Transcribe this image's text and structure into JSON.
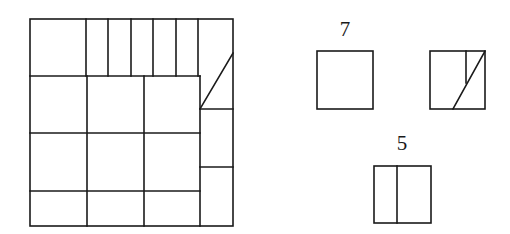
{
  "diagram": {
    "title": "",
    "big_square": {
      "outer": {
        "x1": 30,
        "y1": 19,
        "x2": 233,
        "y2": 226
      },
      "lines": [
        {
          "x1": 30,
          "y1": 76,
          "x2": 200,
          "y2": 76
        },
        {
          "x1": 86,
          "y1": 19,
          "x2": 86,
          "y2": 76
        },
        {
          "x1": 108,
          "y1": 19,
          "x2": 108,
          "y2": 76
        },
        {
          "x1": 131,
          "y1": 19,
          "x2": 131,
          "y2": 76
        },
        {
          "x1": 153,
          "y1": 19,
          "x2": 153,
          "y2": 76
        },
        {
          "x1": 176,
          "y1": 19,
          "x2": 176,
          "y2": 76
        },
        {
          "x1": 198,
          "y1": 19,
          "x2": 198,
          "y2": 76
        },
        {
          "x1": 87,
          "y1": 76,
          "x2": 87,
          "y2": 226
        },
        {
          "x1": 144,
          "y1": 76,
          "x2": 144,
          "y2": 226
        },
        {
          "x1": 200,
          "y1": 76,
          "x2": 200,
          "y2": 226
        },
        {
          "x1": 30,
          "y1": 133,
          "x2": 200,
          "y2": 133
        },
        {
          "x1": 30,
          "y1": 191,
          "x2": 200,
          "y2": 191
        },
        {
          "x1": 200,
          "y1": 109,
          "x2": 233,
          "y2": 109
        },
        {
          "x1": 200,
          "y1": 167,
          "x2": 233,
          "y2": 167
        },
        {
          "x1": 233,
          "y1": 53,
          "x2": 200,
          "y2": 109
        }
      ]
    },
    "pieces": [
      {
        "label": "7",
        "label_pos": {
          "x": 345,
          "y": 36
        },
        "rect": {
          "x1": 317,
          "y1": 51,
          "x2": 373,
          "y2": 109
        },
        "lines": []
      },
      {
        "label": "",
        "label_pos": {
          "x": 458,
          "y": 36
        },
        "rect": {
          "x1": 430,
          "y1": 51,
          "x2": 485,
          "y2": 109
        },
        "lines": [
          {
            "x1": 466,
            "y1": 51,
            "x2": 466,
            "y2": 83
          },
          {
            "x1": 485,
            "y1": 51,
            "x2": 453,
            "y2": 109
          }
        ]
      },
      {
        "label": "5",
        "label_pos": {
          "x": 402,
          "y": 150
        },
        "rect": {
          "x1": 374,
          "y1": 166,
          "x2": 431,
          "y2": 223
        },
        "lines": [
          {
            "x1": 397,
            "y1": 166,
            "x2": 397,
            "y2": 223
          }
        ]
      }
    ]
  }
}
